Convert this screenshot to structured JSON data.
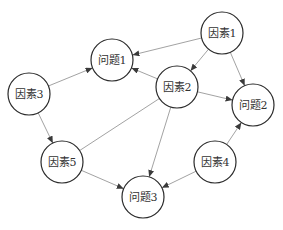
{
  "diagram": {
    "type": "directed-graph",
    "colors": {
      "background": "#ffffff",
      "node_stroke": "#2a2a2a",
      "node_fill": "#ffffff",
      "edge": "#8a8a8a",
      "text": "#333333"
    },
    "node_radius": 21,
    "nodes": [
      {
        "id": "f1",
        "label": "因素1",
        "x": 222,
        "y": 33
      },
      {
        "id": "p1",
        "label": "问题1",
        "x": 112,
        "y": 60
      },
      {
        "id": "f2",
        "label": "因素2",
        "x": 177,
        "y": 87
      },
      {
        "id": "f3",
        "label": "因素3",
        "x": 29,
        "y": 94
      },
      {
        "id": "p2",
        "label": "问题2",
        "x": 253,
        "y": 105
      },
      {
        "id": "f5",
        "label": "因素5",
        "x": 62,
        "y": 162
      },
      {
        "id": "f4",
        "label": "因素4",
        "x": 215,
        "y": 162
      },
      {
        "id": "p3",
        "label": "问题3",
        "x": 143,
        "y": 197
      }
    ],
    "edges": [
      {
        "from": "f1",
        "to": "p1",
        "directed": true
      },
      {
        "from": "f1",
        "to": "f2",
        "directed": true
      },
      {
        "from": "f1",
        "to": "p2",
        "directed": true
      },
      {
        "from": "f3",
        "to": "p1",
        "directed": true
      },
      {
        "from": "f3",
        "to": "f5",
        "directed": true
      },
      {
        "from": "f2",
        "to": "p1",
        "directed": true
      },
      {
        "from": "f2",
        "to": "p2",
        "directed": true
      },
      {
        "from": "f2",
        "to": "p3",
        "directed": true
      },
      {
        "from": "f2",
        "to": "f5",
        "directed": false
      },
      {
        "from": "f5",
        "to": "p3",
        "directed": true
      },
      {
        "from": "f4",
        "to": "p3",
        "directed": true
      },
      {
        "from": "f4",
        "to": "p2",
        "directed": true
      }
    ]
  }
}
